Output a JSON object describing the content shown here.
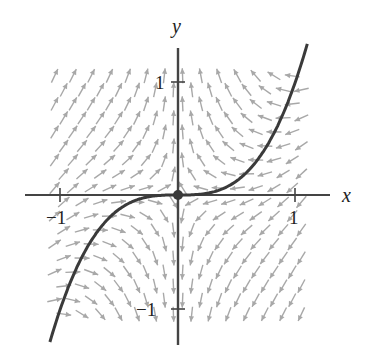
{
  "figure": {
    "title": ""
  },
  "axes": {
    "x_label": "x",
    "y_label": "y",
    "x_ticks": [
      {
        "value": -1,
        "label": "−1"
      },
      {
        "value": 1,
        "label": "1"
      }
    ],
    "y_ticks": [
      {
        "value": 1,
        "label": "1"
      },
      {
        "value": -1,
        "label": "−1"
      }
    ],
    "xlim": [
      -1.3,
      1.3
    ],
    "ylim": [
      -1.3,
      1.3
    ],
    "axis_color": "#444444"
  },
  "chart_data": {
    "type": "vector_field",
    "field": {
      "dx": "-x",
      "dy": "y - x^3"
    },
    "grid": {
      "x_range": [
        -1.05,
        1.05
      ],
      "y_range": [
        -1.05,
        1.05
      ],
      "rows": 18,
      "cols": 14,
      "staggered": true
    },
    "arrow_color": "#a8a8a8",
    "curve": {
      "equation": "y = x^3",
      "x_range": [
        -1.09,
        1.1
      ],
      "color": "#3a3a3a"
    },
    "equilibrium": {
      "x": 0,
      "y": 0,
      "color": "#3a3a3a"
    }
  }
}
